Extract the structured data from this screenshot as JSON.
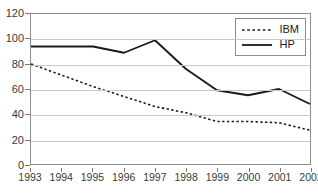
{
  "chart_data": {
    "type": "line",
    "title": "",
    "subtitle": "",
    "xlabel": "",
    "ylabel": "",
    "categories": [
      "1993",
      "1994",
      "1995",
      "1996",
      "1997",
      "1998",
      "1999",
      "2000",
      "2001",
      "2002"
    ],
    "x": [
      1993,
      1994,
      1995,
      1996,
      1997,
      1998,
      1999,
      2000,
      2001,
      2002
    ],
    "series": [
      {
        "name": "IBM",
        "style": "dotted",
        "color": "#1a1a1a",
        "values": [
          80,
          71,
          62,
          54,
          46,
          41,
          34,
          34,
          33,
          27
        ]
      },
      {
        "name": "HP",
        "style": "solid",
        "color": "#1a1a1a",
        "values": [
          94,
          94,
          94,
          89,
          99,
          76,
          59,
          55,
          60,
          48
        ]
      }
    ],
    "ylim": [
      0,
      120
    ],
    "yticks": [
      0,
      20,
      40,
      60,
      80,
      100,
      120
    ],
    "ytick_labels": [
      "0",
      "20",
      "40",
      "60",
      "80",
      "100",
      "120"
    ],
    "xlim": [
      1993,
      2002
    ],
    "grid": "horizontal",
    "grid_color": "#c9c9c9",
    "legend_position": "top-right",
    "legend_entries": [
      "IBM",
      "HP"
    ],
    "background_color": "#ffffff",
    "frame_color": "#8d8d8d"
  }
}
